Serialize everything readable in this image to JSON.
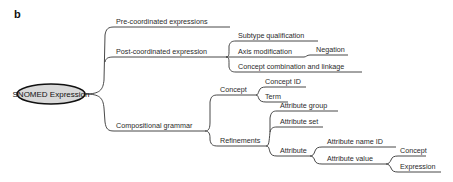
{
  "panel_label": "b",
  "root": {
    "label": "SNOMED Expression",
    "fill": "#d9d9d9"
  },
  "nodes": {
    "pre_coordinated": "Pre-coordinated expressions",
    "post_coordinated": "Post-coordinated expression",
    "subtype_qualification": "Subtype qualification",
    "axis_modification": "Axis modification",
    "negation": "Negation",
    "concept_combination": "Concept combination and linkage",
    "compositional_grammar": "Compositional grammar",
    "concept": "Concept",
    "concept_id": "Concept ID",
    "term": "Term",
    "refinements": "Refinements",
    "attribute_group": "Attribute group",
    "attribute_set": "Attribute set",
    "attribute": "Attribute",
    "attribute_name_id": "Attribute name ID",
    "attribute_value": "Attribute value",
    "av_concept": "Concept",
    "av_expression": "Expression"
  },
  "tree": {
    "label": "SNOMED Expression",
    "children": [
      {
        "label": "Pre-coordinated expressions"
      },
      {
        "label": "Post-coordinated expression",
        "children": [
          {
            "label": "Subtype qualification"
          },
          {
            "label": "Axis modification",
            "children": [
              {
                "label": "Negation"
              }
            ]
          },
          {
            "label": "Concept combination and linkage"
          }
        ]
      },
      {
        "label": "Compositional grammar",
        "children": [
          {
            "label": "Concept",
            "children": [
              {
                "label": "Concept ID"
              },
              {
                "label": "Term"
              }
            ]
          },
          {
            "label": "Refinements",
            "children": [
              {
                "label": "Attribute group"
              },
              {
                "label": "Attribute set"
              },
              {
                "label": "Attribute",
                "children": [
                  {
                    "label": "Attribute name ID"
                  },
                  {
                    "label": "Attribute value",
                    "children": [
                      {
                        "label": "Concept"
                      },
                      {
                        "label": "Expression"
                      }
                    ]
                  }
                ]
              }
            ]
          }
        ]
      }
    ]
  }
}
